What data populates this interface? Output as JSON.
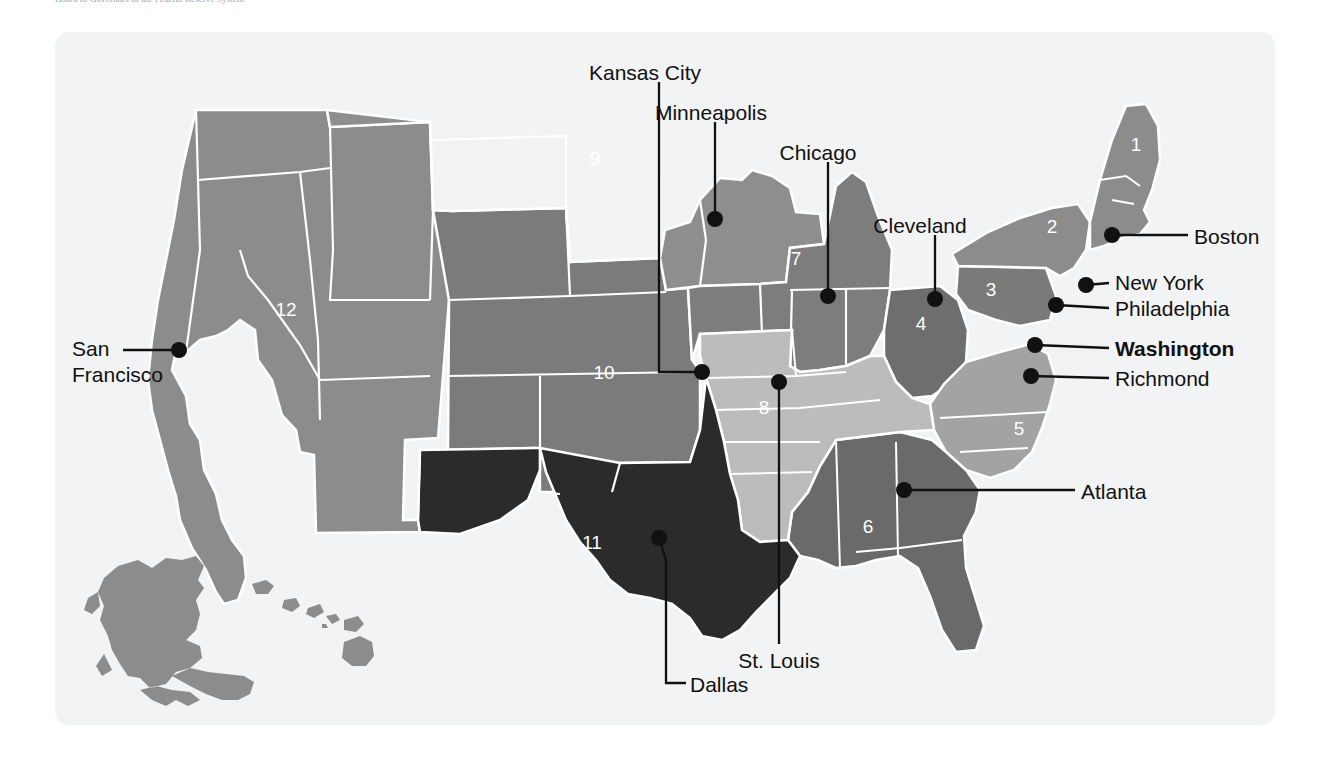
{
  "figure": {
    "caption": "Board of Governors of the Federal Reserve System",
    "panel_bg": "#f2f3f4",
    "page_bg": "#ffffff"
  },
  "map": {
    "type": "choropleth-region-map",
    "region_name": "United States Federal Reserve Districts",
    "border_color": "#ffffff",
    "marker_color": "#111111",
    "leader_color": "#111111",
    "districts": [
      {
        "number": "1",
        "label_x": 1136,
        "label_y": 151,
        "fill": "#8c8c8c",
        "text_color": "#ffffff"
      },
      {
        "number": "2",
        "label_x": 1052,
        "label_y": 233,
        "fill": "#8c8c8c",
        "text_color": "#ffffff"
      },
      {
        "number": "3",
        "label_x": 991,
        "label_y": 296,
        "fill": "#7a7a7a",
        "text_color": "#ffffff"
      },
      {
        "number": "4",
        "label_x": 921,
        "label_y": 330,
        "fill": "#6e6e6e",
        "text_color": "#ffffff"
      },
      {
        "number": "5",
        "label_x": 1019,
        "label_y": 435,
        "fill": "#a3a3a3",
        "text_color": "#ffffff"
      },
      {
        "number": "6",
        "label_x": 868,
        "label_y": 533,
        "fill": "#6a6a6a",
        "text_color": "#ffffff"
      },
      {
        "number": "7",
        "label_x": 796,
        "label_y": 265,
        "fill": "#7d7d7d",
        "text_color": "#ffffff"
      },
      {
        "number": "8",
        "label_x": 764,
        "label_y": 414,
        "fill": "#bcbcbc",
        "text_color": "#ffffff"
      },
      {
        "number": "9",
        "label_x": 595,
        "label_y": 165,
        "fill": "#8e8e8e",
        "text_color": "#ffffff"
      },
      {
        "number": "10",
        "label_x": 604,
        "label_y": 379,
        "fill": "#7b7b7b",
        "text_color": "#ffffff"
      },
      {
        "number": "11",
        "label_x": 592,
        "label_y": 549,
        "fill": "#2b2b2b",
        "text_color": "#ffffff"
      },
      {
        "number": "12",
        "label_x": 286,
        "label_y": 316,
        "fill": "#8c8c8c",
        "text_color": "#ffffff"
      }
    ],
    "cities": [
      {
        "name": "Kansas City",
        "bold": false,
        "dot_x": 702,
        "dot_y": 372,
        "label_x": 645,
        "label_y": 60,
        "align": "center",
        "lines": [
          "Kansas City"
        ]
      },
      {
        "name": "Minneapolis",
        "bold": false,
        "dot_x": 715,
        "dot_y": 219,
        "label_x": 711,
        "label_y": 100,
        "align": "center",
        "lines": [
          "Minneapolis"
        ]
      },
      {
        "name": "Chicago",
        "bold": false,
        "dot_x": 828,
        "dot_y": 296,
        "label_x": 818,
        "label_y": 140,
        "align": "center",
        "lines": [
          "Chicago"
        ]
      },
      {
        "name": "Cleveland",
        "bold": false,
        "dot_x": 935,
        "dot_y": 299,
        "label_x": 920,
        "label_y": 213,
        "align": "center",
        "lines": [
          "Cleveland"
        ]
      },
      {
        "name": "Boston",
        "bold": false,
        "dot_x": 1112,
        "dot_y": 235,
        "label_x": 1194,
        "label_y": 224,
        "align": "left",
        "lines": [
          "Boston"
        ]
      },
      {
        "name": "New York",
        "bold": false,
        "dot_x": 1086,
        "dot_y": 285,
        "label_x": 1115,
        "label_y": 270,
        "align": "left",
        "lines": [
          "New York"
        ]
      },
      {
        "name": "Philadelphia",
        "bold": false,
        "dot_x": 1056,
        "dot_y": 305,
        "label_x": 1115,
        "label_y": 296,
        "align": "left",
        "lines": [
          "Philadelphia"
        ]
      },
      {
        "name": "Washington",
        "bold": true,
        "dot_x": 1035,
        "dot_y": 345,
        "label_x": 1115,
        "label_y": 336,
        "align": "left",
        "lines": [
          "Washington"
        ]
      },
      {
        "name": "Richmond",
        "bold": false,
        "dot_x": 1031,
        "dot_y": 376,
        "label_x": 1115,
        "label_y": 366,
        "align": "left",
        "lines": [
          "Richmond"
        ]
      },
      {
        "name": "Atlanta",
        "bold": false,
        "dot_x": 904,
        "dot_y": 490,
        "label_x": 1081,
        "label_y": 479,
        "align": "left",
        "lines": [
          "Atlanta"
        ]
      },
      {
        "name": "San Francisco",
        "bold": false,
        "dot_x": 179,
        "dot_y": 350,
        "label_x": 72,
        "label_y": 336,
        "align": "left",
        "lines": [
          "San",
          "Francisco"
        ]
      },
      {
        "name": "St. Louis",
        "bold": false,
        "dot_x": 779,
        "dot_y": 382,
        "label_x": 779,
        "label_y": 648,
        "align": "center",
        "lines": [
          "St. Louis"
        ]
      },
      {
        "name": "Dallas",
        "bold": false,
        "dot_x": 659,
        "dot_y": 538,
        "label_x": 690,
        "label_y": 672,
        "align": "left",
        "lines": [
          "Dallas"
        ]
      }
    ]
  }
}
